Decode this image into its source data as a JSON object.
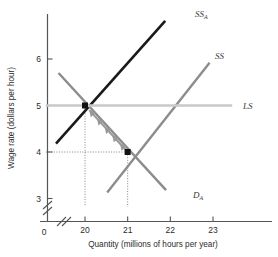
{
  "chart_data": {
    "type": "line",
    "title": "",
    "xlabel": "Quantity (millions of hours per year)",
    "ylabel": "Wage rate (dollars per hour)",
    "xlim": [
      19.0,
      23.6
    ],
    "ylim": [
      2.8,
      7.1
    ],
    "xticks": [
      20,
      21,
      22,
      23
    ],
    "xtick_labels": [
      "20",
      "21",
      "22",
      "23"
    ],
    "yticks": [
      3,
      4,
      5,
      6
    ],
    "ytick_labels": [
      "3",
      "4",
      "5",
      "6"
    ],
    "origin_label": "0",
    "grid": false,
    "axis_break_x": true,
    "axis_break_y": true,
    "legend_position": "inline-end-of-curve",
    "series": [
      {
        "name": "SS_A",
        "label": "SS",
        "sublabel": "A",
        "color": "#1a1a1a",
        "width": 2.6,
        "description": "Short-run supply of labour after change, upward sloping",
        "points": [
          [
            19.32,
            4.18
          ],
          [
            21.88,
            6.82
          ]
        ]
      },
      {
        "name": "SS",
        "label": "SS",
        "sublabel": "",
        "color": "#8c8c8c",
        "width": 2.4,
        "description": "Short-run supply of labour, upward sloping",
        "points": [
          [
            20.52,
            3.13
          ],
          [
            22.92,
            5.92
          ]
        ]
      },
      {
        "name": "D_A",
        "label": "D",
        "sublabel": "A",
        "color": "#8c8c8c",
        "width": 2.4,
        "description": "Demand for labour, downward sloping",
        "points": [
          [
            19.38,
            5.7
          ],
          [
            21.9,
            3.18
          ]
        ]
      },
      {
        "name": "LS",
        "label": "LS",
        "sublabel": "",
        "color": "#c9c9c9",
        "width": 2.4,
        "description": "Long-run supply of labour, horizontal at wage 5",
        "points": [
          [
            19.08,
            5.0
          ],
          [
            23.45,
            5.0
          ]
        ]
      }
    ],
    "markers": [
      {
        "name": "equilibrium-upper",
        "x": 20,
        "y": 5,
        "shape": "square",
        "color": "#111111",
        "size": 6
      },
      {
        "name": "equilibrium-lower",
        "x": 21,
        "y": 4,
        "shape": "square",
        "color": "#111111",
        "size": 6
      }
    ],
    "droplines": [
      {
        "name": "dropline-x-20",
        "from": [
          20,
          5
        ],
        "to": [
          20,
          2.82
        ],
        "style": "dotted"
      },
      {
        "name": "dropline-x-21",
        "from": [
          21,
          4
        ],
        "to": [
          21,
          2.82
        ],
        "style": "dotted"
      },
      {
        "name": "dropline-y-4",
        "from": [
          21,
          4
        ],
        "to": [
          19.08,
          4
        ],
        "style": "dotted"
      }
    ],
    "annotations": [
      {
        "name": "adjustment-arrow",
        "type": "multi-chevron-arrow",
        "from": [
          21,
          4
        ],
        "to": [
          20.1,
          4.9
        ],
        "color": "#999999",
        "chevrons": 5,
        "direction": "up-left",
        "description": "Adjustment path from the point (21, 4) to the point (20, 5)"
      }
    ],
    "curve_labels": [
      {
        "name": "label-ss-a",
        "text": "SS",
        "sub": "A",
        "x": 195,
        "y": 17
      },
      {
        "name": "label-ss",
        "text": "SS",
        "sub": "",
        "x": 215,
        "y": 59
      },
      {
        "name": "label-ls",
        "text": "LS",
        "sub": "",
        "x": 243,
        "y": 109
      },
      {
        "name": "label-d-a",
        "text": "D",
        "sub": "A",
        "x": 193,
        "y": 198
      }
    ]
  }
}
